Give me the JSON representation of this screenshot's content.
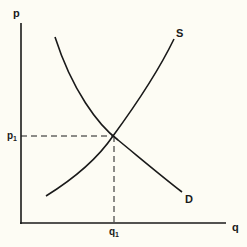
{
  "diagram": {
    "type": "supply-demand",
    "colors": {
      "background": "#fdfcf4",
      "ink": "#1a1a1a"
    },
    "axes": {
      "y_label": "p",
      "x_label": "q"
    },
    "curves": {
      "supply_label": "S",
      "demand_label": "D"
    },
    "equilibrium": {
      "price_label": "p",
      "price_subscript": "1",
      "quantity_label": "q",
      "quantity_subscript": "1"
    }
  }
}
